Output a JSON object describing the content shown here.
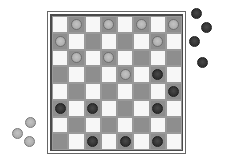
{
  "game": "checkers",
  "board": {
    "size": 8,
    "colors": {
      "light_square": "#f7f7f7",
      "dark_square": "#8e8e8e",
      "light_piece": "#b0b0b0",
      "dark_piece": "#333333",
      "frame": "#4a4a4a"
    },
    "pieces": [
      {
        "row": 0,
        "col": 1,
        "color": "light"
      },
      {
        "row": 0,
        "col": 3,
        "color": "light"
      },
      {
        "row": 0,
        "col": 5,
        "color": "light"
      },
      {
        "row": 0,
        "col": 7,
        "color": "light"
      },
      {
        "row": 1,
        "col": 0,
        "color": "light"
      },
      {
        "row": 1,
        "col": 6,
        "color": "light"
      },
      {
        "row": 2,
        "col": 1,
        "color": "light"
      },
      {
        "row": 2,
        "col": 3,
        "color": "light"
      },
      {
        "row": 3,
        "col": 4,
        "color": "light"
      },
      {
        "row": 3,
        "col": 6,
        "color": "dark"
      },
      {
        "row": 4,
        "col": 7,
        "color": "dark"
      },
      {
        "row": 5,
        "col": 0,
        "color": "dark"
      },
      {
        "row": 5,
        "col": 2,
        "color": "dark"
      },
      {
        "row": 5,
        "col": 6,
        "color": "dark"
      },
      {
        "row": 7,
        "col": 2,
        "color": "dark"
      },
      {
        "row": 7,
        "col": 4,
        "color": "dark"
      },
      {
        "row": 7,
        "col": 6,
        "color": "dark"
      }
    ]
  },
  "captured": {
    "dark": [
      {
        "x": 191,
        "y": 8
      },
      {
        "x": 201,
        "y": 22
      },
      {
        "x": 189,
        "y": 36
      },
      {
        "x": 197,
        "y": 57
      }
    ],
    "light": [
      {
        "x": 25,
        "y": 117
      },
      {
        "x": 12,
        "y": 128
      },
      {
        "x": 24,
        "y": 136
      }
    ]
  }
}
